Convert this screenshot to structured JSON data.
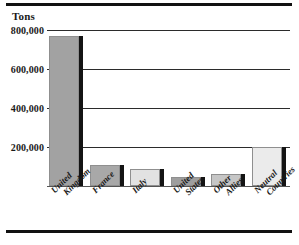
{
  "chart_data": {
    "type": "bar",
    "title": "",
    "subtitle": "",
    "xlabel": "",
    "ylabel": "Tons",
    "categories": [
      "United Kingdom",
      "France",
      "Italy",
      "United States",
      "Other Allies",
      "Neutral Countries"
    ],
    "category_lines": [
      [
        "United",
        "Kingdom"
      ],
      [
        "France"
      ],
      [
        "Italy"
      ],
      [
        "United",
        "States"
      ],
      [
        "Other",
        "Allies"
      ],
      [
        "Neutral",
        "Countries"
      ]
    ],
    "values": [
      770000,
      110000,
      85000,
      45000,
      62000,
      200000
    ],
    "ylim": [
      0,
      800000
    ],
    "yticks": [
      200000,
      400000,
      600000,
      800000
    ],
    "ytick_labels": [
      "200,000",
      "400,000",
      "600,000",
      "800,000"
    ],
    "grid": true,
    "legend": false,
    "bar_colors": [
      "#a2a2a2",
      "#a8a8a8",
      "#e2e2e2",
      "#9e9e9e",
      "#c6c6c6",
      "#ebebeb"
    ],
    "shadow_color": "#141414",
    "gridline_color": "#2b2b2b",
    "rule_color": "#111111"
  },
  "frame": {
    "top_rule": "horizontal-rule",
    "bottom_rule": "horizontal-rule"
  }
}
